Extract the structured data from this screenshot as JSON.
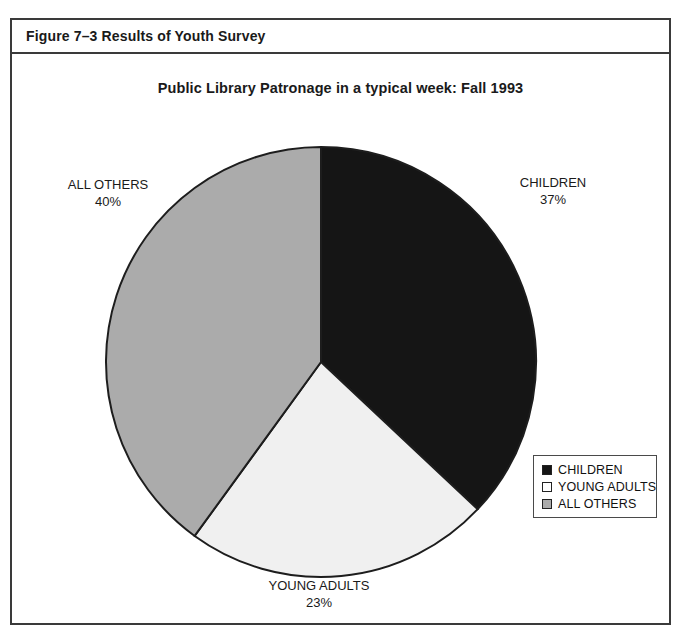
{
  "figure": {
    "caption": "Figure 7–3 Results of Youth Survey"
  },
  "chart_data": {
    "type": "pie",
    "title": "Public Library Patronage in a typical week: Fall 1993",
    "xlabel": "",
    "ylabel": "",
    "categories": [
      "CHILDREN",
      "YOUNG ADULTS",
      "ALL OTHERS"
    ],
    "values": [
      37,
      23,
      40
    ],
    "value_unit": "%",
    "value_labels": [
      "37%",
      "23%",
      "40%"
    ],
    "colors": [
      "#151515",
      "#f0f0f0",
      "#ababab"
    ],
    "start_angle_deg": 0,
    "direction": "clockwise",
    "legend_position": "bottom-right",
    "grid": false,
    "slices": [
      {
        "name": "CHILDREN",
        "label": "CHILDREN",
        "percent_label": "37%",
        "value": 37,
        "color": "#151515",
        "start_deg": 0,
        "end_deg": 133.2
      },
      {
        "name": "YOUNG ADULTS",
        "label": "YOUNG ADULTS",
        "percent_label": "23%",
        "value": 23,
        "color": "#f0f0f0",
        "start_deg": 133.2,
        "end_deg": 216.0
      },
      {
        "name": "ALL OTHERS",
        "label": "ALL OTHERS",
        "percent_label": "40%",
        "value": 40,
        "color": "#ababab",
        "start_deg": 216.0,
        "end_deg": 360.0
      }
    ]
  },
  "legend": {
    "items": [
      {
        "label": "CHILDREN",
        "color": "#151515"
      },
      {
        "label": "YOUNG ADULTS",
        "color": "#ffffff"
      },
      {
        "label": "ALL OTHERS",
        "color": "#ababab"
      }
    ]
  }
}
